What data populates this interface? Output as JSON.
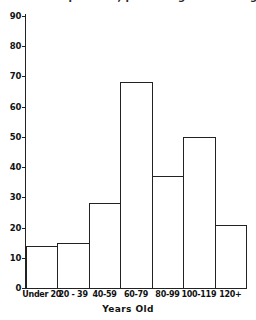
{
  "chart_data": {
    "type": "bar",
    "title": "Age distribution of patients, percentage in each age group",
    "title_cropped": true,
    "categories": [
      "Under 20",
      "20 - 39",
      "40-59",
      "60-79",
      "80-99",
      "100-119",
      "120+"
    ],
    "values": [
      14,
      15,
      28,
      68,
      37,
      50,
      21
    ],
    "xlabel": "Years  Old",
    "ylabel": "",
    "ylim": [
      0,
      90
    ],
    "ytick_labels": [
      "0",
      "10",
      "20",
      "30",
      "40",
      "50",
      "60",
      "70",
      "80",
      "90"
    ],
    "ytick_values": [
      0,
      10,
      20,
      30,
      40,
      50,
      60,
      70,
      80,
      90
    ],
    "grid": false,
    "legend": false,
    "bar_style": "outline",
    "bar_fill_color": "#ffffff",
    "bar_edge_color": "#222222",
    "axis_color": "#222222",
    "background_color": "#ffffff"
  }
}
